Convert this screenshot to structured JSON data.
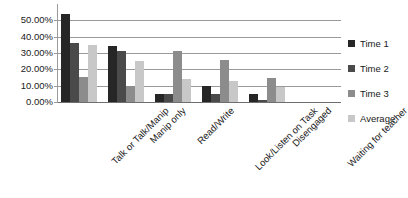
{
  "chart_data": {
    "type": "bar",
    "title": "",
    "xlabel": "",
    "ylabel": "",
    "ylim": [
      0,
      60
    ],
    "grid": true,
    "legend_position": "right",
    "y_ticks": [
      "0.00%",
      "10.00%",
      "20.00%",
      "30.00%",
      "40.00%",
      "50.00%"
    ],
    "y_tick_values": [
      0,
      10,
      20,
      30,
      40,
      50
    ],
    "categories": [
      "Talk or Talk/Manip",
      "Manip only",
      "Read/Write",
      "Look/Listen on Task",
      "Disengaged",
      "Waiting for teacher"
    ],
    "series": [
      {
        "name": "Time 1",
        "color": "#262626",
        "values": [
          54.0,
          34.0,
          5.0,
          10.0,
          5.0,
          0.0
        ]
      },
      {
        "name": "Time 2",
        "color": "#4a4a4a",
        "values": [
          36.0,
          31.0,
          5.0,
          5.0,
          1.0,
          0.0
        ]
      },
      {
        "name": "Time 3",
        "color": "#8c8c8c",
        "values": [
          15.5,
          10.0,
          31.0,
          26.0,
          15.0,
          0.0
        ]
      },
      {
        "name": "Average",
        "color": "#c8c8c8",
        "values": [
          35.0,
          25.0,
          14.0,
          13.0,
          9.0,
          0.0
        ]
      }
    ]
  }
}
